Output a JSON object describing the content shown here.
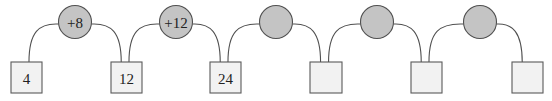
{
  "diagram": {
    "colors": {
      "box_fill": "#f2f2f2",
      "box_stroke": "#5a5a5a",
      "circle_fill": "#c4c4c4",
      "circle_stroke": "#505050",
      "arc_stroke": "#505050",
      "text": "#222222"
    },
    "boxes": [
      {
        "value": "4",
        "x": 11,
        "y": 62,
        "w": 31,
        "h": 31
      },
      {
        "value": "12",
        "x": 111,
        "y": 62,
        "w": 31,
        "h": 31
      },
      {
        "value": "24",
        "x": 210,
        "y": 62,
        "w": 31,
        "h": 31
      },
      {
        "value": "",
        "x": 310,
        "y": 62,
        "w": 32,
        "h": 31
      },
      {
        "value": "",
        "x": 411,
        "y": 62,
        "w": 31,
        "h": 31
      },
      {
        "value": "",
        "x": 512,
        "y": 62,
        "w": 31,
        "h": 31
      }
    ],
    "operations": [
      {
        "label": "+8",
        "cx": 75,
        "cy": 22,
        "r": 16.5
      },
      {
        "label": "+12",
        "cx": 176,
        "cy": 22,
        "r": 16.5
      },
      {
        "label": "",
        "cx": 276,
        "cy": 22,
        "r": 16.5
      },
      {
        "label": "",
        "cx": 377,
        "cy": 22,
        "r": 16.5
      },
      {
        "label": "",
        "cx": 480,
        "cy": 22,
        "r": 16.5
      }
    ]
  }
}
